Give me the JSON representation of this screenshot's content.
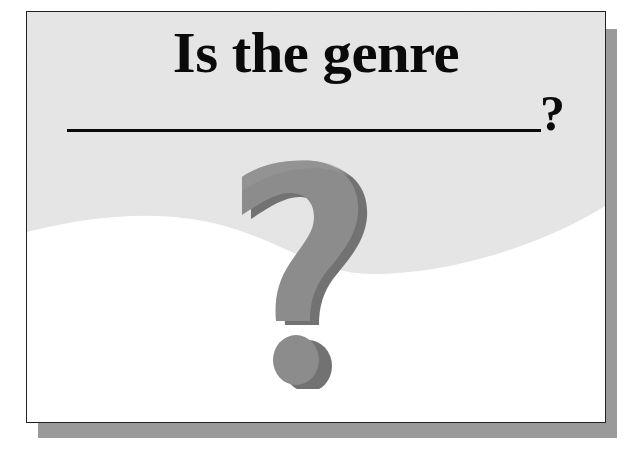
{
  "slide": {
    "title": "Is the genre",
    "blank_suffix": "?",
    "blank_line": "fill-in-the-blank line",
    "graphic": {
      "icon": "question-mark-3d-icon",
      "front_color": "#8c8c8c",
      "side_color": "#727272"
    },
    "colors": {
      "card_background": "#ffffff",
      "wave_fill": "#e6e6e6",
      "border": "#222222",
      "shadow": "#9a9a9a",
      "text": "#0a0a0a"
    }
  }
}
